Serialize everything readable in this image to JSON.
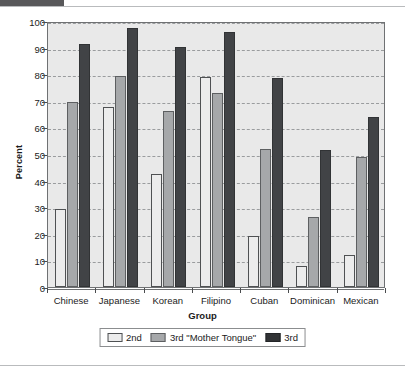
{
  "chart_data": {
    "type": "bar",
    "title": "",
    "xlabel": "Group",
    "ylabel": "Percent",
    "ylim": [
      0,
      100
    ],
    "yticks": [
      0,
      10,
      20,
      30,
      40,
      50,
      60,
      70,
      80,
      90,
      100
    ],
    "grid": true,
    "legend_position": "bottom",
    "categories": [
      "Chinese",
      "Japanese",
      "Korean",
      "Filipino",
      "Cuban",
      "Dominican",
      "Mexican"
    ],
    "series": [
      {
        "name": "2nd",
        "color": "#ececec",
        "values": [
          29.5,
          67.5,
          42.5,
          79.0,
          19.0,
          8.0,
          12.0
        ]
      },
      {
        "name": "3rd \"Mother Tongue\"",
        "color": "#a6a8aa",
        "values": [
          69.5,
          79.5,
          66.0,
          72.8,
          52.0,
          26.3,
          49.0
        ]
      },
      {
        "name": "3rd",
        "color": "#313335",
        "values": [
          91.3,
          97.5,
          90.3,
          95.7,
          78.5,
          51.5,
          64.0
        ]
      }
    ]
  },
  "legend": {
    "entries": [
      {
        "label": "2nd"
      },
      {
        "label": "3rd \"Mother Tongue\""
      },
      {
        "label": "3rd"
      }
    ]
  },
  "decoration": {
    "top_tab_color": "#58585a",
    "rule_color": "#b9bbbd",
    "plot_background": "#e9e9e9",
    "axis_color": "#6f7173"
  }
}
